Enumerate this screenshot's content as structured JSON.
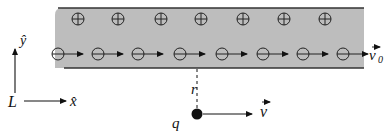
{
  "diagram": {
    "colors": {
      "slab_fill": "#bdbdbd",
      "slab_edge": "#333333",
      "ink": "#111111",
      "background": "#ffffff"
    },
    "slab": {
      "x": 55,
      "y": 8,
      "width": 309,
      "height": 60
    },
    "positive_charges": {
      "symbol": "⊕",
      "y": 19,
      "x": [
        78,
        118,
        161,
        201,
        243,
        284,
        325
      ]
    },
    "negative_charges": {
      "symbol": "⊖",
      "y": 54,
      "x": [
        58,
        98,
        138,
        180,
        222,
        263,
        303,
        343
      ]
    },
    "labels": {
      "v0": "v",
      "v0_sub": "0",
      "r": "r",
      "q": "q",
      "v": "v",
      "y_hat": "ŷ",
      "x_hat": "x̂",
      "L": "L"
    },
    "point_charge": {
      "x": 197,
      "y": 114
    }
  }
}
